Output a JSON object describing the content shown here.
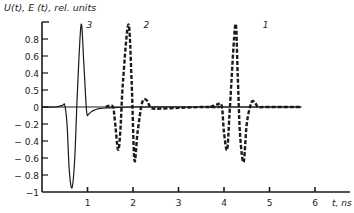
{
  "chart_data": {
    "type": "line",
    "title": "",
    "ylabel": "U(t), E (t), rel. units",
    "xlabel": "t, ns",
    "xlim": [
      0,
      6.7
    ],
    "ylim": [
      -1,
      1
    ],
    "grid": false,
    "x_ticks": [
      1,
      2,
      3,
      4,
      5,
      6
    ],
    "x_tick_labels": [
      "1",
      "2",
      "3",
      "4",
      "5",
      "6"
    ],
    "y_ticks": [
      0.8,
      0.6,
      0.4,
      0.2,
      0,
      -0.2,
      -0.4,
      -0.6,
      -0.8,
      -1
    ],
    "y_tick_labels": [
      "0.8",
      "0.6",
      "0.4",
      "0.5",
      "0",
      "− 0.2",
      "− 0.4",
      "− 0.6",
      "− 0.8",
      "−1"
    ],
    "series": [
      {
        "name": "3",
        "style": "solid",
        "x": [
          0,
          0.3,
          0.45,
          0.5,
          0.55,
          0.6,
          0.66,
          0.72,
          0.78,
          0.86,
          0.92,
          0.98,
          1.03,
          1.1,
          1.25,
          1.5,
          2.0,
          3.0,
          4.0,
          5.0,
          5.7
        ],
        "y": [
          0,
          0,
          0.02,
          0.02,
          -0.2,
          -0.75,
          -0.95,
          -0.6,
          0.2,
          0.97,
          0.5,
          -0.05,
          -0.08,
          -0.05,
          -0.02,
          -0.01,
          0,
          0,
          0,
          0,
          0
        ]
      },
      {
        "name": "2",
        "style": "dashed",
        "x": [
          1.4,
          1.55,
          1.6,
          1.67,
          1.72,
          1.78,
          1.9,
          1.97,
          2.03,
          2.1,
          2.2,
          2.3,
          2.38,
          2.5,
          3.0,
          3.5,
          3.9
        ],
        "y": [
          0,
          0.01,
          -0.15,
          -0.5,
          -0.3,
          0.3,
          0.97,
          0.3,
          -0.62,
          -0.3,
          0.05,
          0.08,
          0.0,
          -0.02,
          -0.01,
          0,
          0
        ]
      },
      {
        "name": "1",
        "style": "dashed",
        "x": [
          3.7,
          3.85,
          3.95,
          4.0,
          4.07,
          4.13,
          4.25,
          4.3,
          4.35,
          4.43,
          4.5,
          4.6,
          4.68,
          4.75,
          4.9,
          5.5,
          5.7
        ],
        "y": [
          0,
          0.03,
          0.01,
          -0.3,
          -0.5,
          0.0,
          0.97,
          0.4,
          -0.3,
          -0.65,
          -0.2,
          0.05,
          0.05,
          0.0,
          0,
          0,
          0
        ]
      }
    ],
    "annotations": [
      {
        "text": "3",
        "x": 0.98,
        "y": 0.93
      },
      {
        "text": "2",
        "x": 2.23,
        "y": 0.93
      },
      {
        "text": "1",
        "x": 4.85,
        "y": 0.93
      }
    ]
  }
}
